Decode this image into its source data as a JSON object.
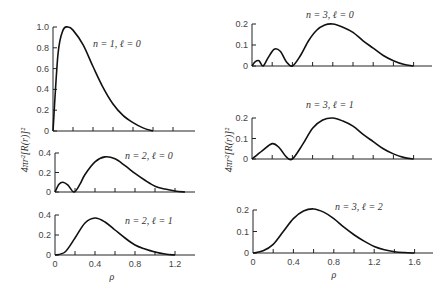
{
  "chart_data": {
    "type": "line",
    "title": "",
    "ylabel": "4πr²[R(r)]²",
    "xlabel": "ρ",
    "grid": false,
    "legend": "none",
    "panels": [
      {
        "id": "n1l0",
        "label_n": "n = 1,",
        "label_l": "ℓ = 0",
        "xlim": [
          0,
          1.4
        ],
        "ylim": [
          0,
          1.0
        ],
        "yticks": [
          "0",
          "0.2",
          "0.4",
          "0.6",
          "0.8",
          "1.0"
        ],
        "xticks": [],
        "x": [
          0,
          0.05,
          0.1,
          0.15,
          0.2,
          0.3,
          0.4,
          0.5,
          0.6,
          0.7,
          0.8,
          0.9,
          1.0
        ],
        "values": [
          0,
          0.74,
          0.97,
          1.0,
          0.97,
          0.83,
          0.62,
          0.42,
          0.26,
          0.15,
          0.08,
          0.03,
          0.0
        ]
      },
      {
        "id": "n2l0",
        "label_n": "n = 2,",
        "label_l": "ℓ = 0",
        "xlim": [
          0,
          1.4
        ],
        "ylim": [
          0,
          0.4
        ],
        "yticks": [
          "0",
          "0.2",
          "0.4"
        ],
        "xticks": [],
        "x": [
          0,
          0.04,
          0.08,
          0.13,
          0.19,
          0.25,
          0.3,
          0.4,
          0.5,
          0.6,
          0.7,
          0.8,
          0.9,
          1.0,
          1.1,
          1.2,
          1.3
        ],
        "values": [
          0,
          0.08,
          0.1,
          0.07,
          0.0,
          0.08,
          0.18,
          0.31,
          0.36,
          0.34,
          0.27,
          0.19,
          0.12,
          0.06,
          0.03,
          0.01,
          0.0
        ]
      },
      {
        "id": "n2l1",
        "label_n": "n = 2,",
        "label_l": "ℓ = 1",
        "xlim": [
          0,
          1.4
        ],
        "ylim": [
          0,
          0.4
        ],
        "yticks": [
          "0",
          "0.2",
          "0.4"
        ],
        "xticks": [
          "0",
          "0.4",
          "0.8",
          "1.2"
        ],
        "x": [
          0,
          0.1,
          0.2,
          0.3,
          0.4,
          0.5,
          0.6,
          0.7,
          0.8,
          0.9,
          1.0,
          1.1,
          1.2
        ],
        "values": [
          0,
          0.03,
          0.17,
          0.32,
          0.37,
          0.33,
          0.25,
          0.17,
          0.1,
          0.06,
          0.03,
          0.01,
          0.0
        ]
      },
      {
        "id": "n3l0",
        "label_n": "n = 3,",
        "label_l": "ℓ = 0",
        "xlim": [
          0,
          1.8
        ],
        "ylim": [
          0,
          0.2
        ],
        "yticks": [
          "0",
          "0.1",
          "0.2"
        ],
        "xticks": [],
        "x": [
          0,
          0.03,
          0.07,
          0.11,
          0.16,
          0.22,
          0.28,
          0.34,
          0.4,
          0.48,
          0.56,
          0.64,
          0.72,
          0.8,
          0.9,
          1.0,
          1.1,
          1.2,
          1.3,
          1.4,
          1.5,
          1.6
        ],
        "values": [
          0,
          0.02,
          0.025,
          0.0,
          0.04,
          0.08,
          0.07,
          0.02,
          0.0,
          0.05,
          0.12,
          0.17,
          0.195,
          0.2,
          0.185,
          0.16,
          0.12,
          0.085,
          0.05,
          0.025,
          0.008,
          0.0
        ]
      },
      {
        "id": "n3l1",
        "label_n": "n = 3,",
        "label_l": "ℓ = 1",
        "xlim": [
          0,
          1.8
        ],
        "ylim": [
          0,
          0.2
        ],
        "yticks": [
          "0",
          "0.1",
          "0.2"
        ],
        "xticks": [],
        "x": [
          0,
          0.1,
          0.2,
          0.27,
          0.34,
          0.4,
          0.5,
          0.6,
          0.7,
          0.8,
          0.9,
          1.0,
          1.1,
          1.2,
          1.3,
          1.4,
          1.5,
          1.6
        ],
        "values": [
          0,
          0.04,
          0.075,
          0.055,
          0.01,
          0.0,
          0.07,
          0.15,
          0.19,
          0.2,
          0.185,
          0.16,
          0.12,
          0.085,
          0.05,
          0.025,
          0.008,
          0.0
        ]
      },
      {
        "id": "n3l2",
        "label_n": "n = 3,",
        "label_l": "ℓ = 2",
        "xlim": [
          0,
          1.8
        ],
        "ylim": [
          0,
          0.2
        ],
        "yticks": [
          "0",
          "0.1",
          "0.2"
        ],
        "xticks": [
          "0",
          "0.4",
          "0.8",
          "1.2",
          "1.6"
        ],
        "x": [
          0,
          0.1,
          0.2,
          0.3,
          0.4,
          0.5,
          0.6,
          0.7,
          0.8,
          0.9,
          1.0,
          1.1,
          1.2,
          1.3,
          1.4,
          1.5,
          1.6
        ],
        "values": [
          0,
          0.01,
          0.04,
          0.1,
          0.16,
          0.195,
          0.205,
          0.19,
          0.16,
          0.12,
          0.085,
          0.055,
          0.03,
          0.015,
          0.006,
          0.002,
          0.0
        ]
      }
    ]
  },
  "labels": {
    "ylabel_text": "4πr²[R(r)]²",
    "xlabel_left": "ρ",
    "xlabel_right": "ρ"
  }
}
